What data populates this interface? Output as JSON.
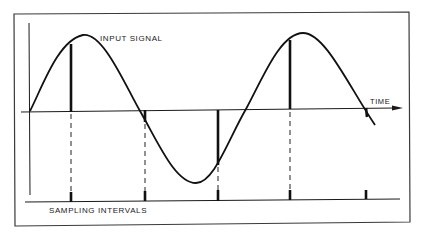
{
  "diagram": {
    "labels": {
      "input_signal": "INPUT SIGNAL",
      "time": "TIME",
      "sampling_intervals": "SAMPLING INTERVALS"
    },
    "colors": {
      "ink": "#1a1a1a",
      "background": "#ffffff"
    },
    "signal": {
      "shape": "sinusoid",
      "points": [
        {
          "x": 30,
          "y": 111,
          "note": "start"
        },
        {
          "x": 83,
          "y": 35,
          "note": "peak"
        },
        {
          "x": 140,
          "y": 111,
          "note": "zero crossing"
        },
        {
          "x": 196,
          "y": 183,
          "note": "trough"
        },
        {
          "x": 246,
          "y": 109,
          "note": "zero crossing"
        },
        {
          "x": 303,
          "y": 33,
          "note": "peak"
        },
        {
          "x": 375,
          "y": 125,
          "note": "end"
        }
      ]
    },
    "samples": [
      {
        "index": 1,
        "x": 71,
        "sign": "positive"
      },
      {
        "index": 2,
        "x": 145,
        "sign": "negative-small"
      },
      {
        "index": 3,
        "x": 218,
        "sign": "negative"
      },
      {
        "index": 4,
        "x": 290,
        "sign": "positive"
      },
      {
        "index": 5,
        "x": 366,
        "sign": "negative-small"
      }
    ]
  }
}
